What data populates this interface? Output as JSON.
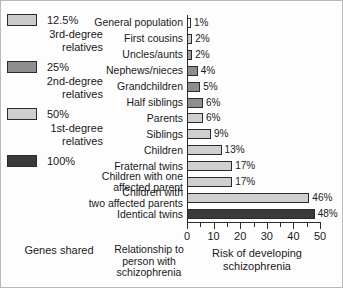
{
  "legend": {
    "title": "Genes shared",
    "items": [
      {
        "pct": "12.5%",
        "line1": "3rd-degree",
        "line2": "relatives",
        "color": "#c9c9c9"
      },
      {
        "pct": "25%",
        "line1": "2nd-degree",
        "line2": "relatives",
        "color": "#8e8e8e"
      },
      {
        "pct": "50%",
        "line1": "1st-degree",
        "line2": "relatives",
        "color": "#cfcfcf"
      },
      {
        "pct": "100%",
        "line1": "",
        "line2": "",
        "color": "#3a3a3a"
      }
    ]
  },
  "axis": {
    "title_line1": "Risk of developing",
    "title_line2": "schizophrenia",
    "category_title_line1": "Relationship to",
    "category_title_line2": "person with",
    "category_title_line3": "schizophrenia",
    "ticks": [
      "0",
      "10",
      "20",
      "30",
      "40",
      "50"
    ]
  },
  "chart_data": {
    "type": "bar",
    "title": "",
    "xlabel": "Risk of developing schizophrenia",
    "ylabel": "Relationship to person with schizophrenia",
    "xlim": [
      0,
      50
    ],
    "orientation": "horizontal",
    "grid": false,
    "legend_position": "left",
    "categories": [
      "General population",
      "First cousins",
      "Uncles/aunts",
      "Nephews/nieces",
      "Grandchildren",
      "Half siblings",
      "Parents",
      "Siblings",
      "Children",
      "Fraternal twins",
      "Children with one affected parent",
      "Children with two affected parents",
      "Identical twins"
    ],
    "category_lines": [
      [
        "General population"
      ],
      [
        "First cousins"
      ],
      [
        "Uncles/aunts"
      ],
      [
        "Nephews/nieces"
      ],
      [
        "Grandchildren"
      ],
      [
        "Half siblings"
      ],
      [
        "Parents"
      ],
      [
        "Siblings"
      ],
      [
        "Children"
      ],
      [
        "Fraternal twins"
      ],
      [
        "Children with one",
        "affected parent"
      ],
      [
        "Children with",
        "two affected parents"
      ],
      [
        "Identical twins"
      ]
    ],
    "values": [
      1,
      2,
      2,
      4,
      5,
      6,
      6,
      9,
      13,
      17,
      17,
      46,
      48
    ],
    "value_labels": [
      "1%",
      "2%",
      "2%",
      "4%",
      "5%",
      "6%",
      "6%",
      "9%",
      "13%",
      "17%",
      "17%",
      "46%",
      "48%"
    ],
    "bar_colors": [
      "#ffffff",
      "#c9c9c9",
      "#9a9a9a",
      "#8e8e8e",
      "#8e8e8e",
      "#8e8e8e",
      "#cfcfcf",
      "#cfcfcf",
      "#cfcfcf",
      "#cfcfcf",
      "#cfcfcf",
      "#cfcfcf",
      "#3a3a3a"
    ],
    "genes_shared_group": [
      "12.5%",
      "12.5%",
      "12.5%",
      "25%",
      "25%",
      "25%",
      "50%",
      "50%",
      "50%",
      "50%",
      "50%",
      "50%",
      "100%"
    ]
  }
}
